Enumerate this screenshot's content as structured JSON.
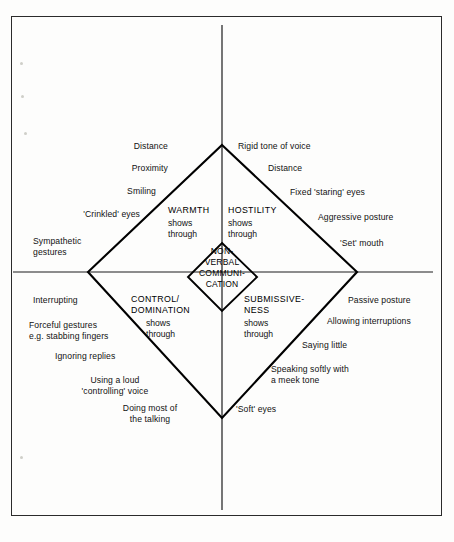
{
  "figure": {
    "type": "diagram",
    "subtype": "four-quadrant-diamond",
    "core_label": "NON-\nVERBAL\nCOMMUNI-\nCATION",
    "axes": {
      "vertical": "unlabelled vertical axis",
      "horizontal": "unlabelled horizontal axis"
    }
  },
  "quadrants": {
    "top_left": {
      "title": "WARMTH",
      "subtitle": "shows\nthrough",
      "cues": [
        "Distance",
        "Proximity",
        "Smiling",
        "'Crinkled' eyes",
        "Sympathetic\ngestures"
      ]
    },
    "top_right": {
      "title": "HOSTILITY",
      "subtitle": "shows\nthrough",
      "cues": [
        "Rigid tone of voice",
        "Distance",
        "Fixed 'staring' eyes",
        "Aggressive posture",
        "'Set' mouth"
      ]
    },
    "bottom_left": {
      "title": "CONTROL/\nDOMINATION",
      "subtitle": "shows\nthrough",
      "cues": [
        "Interrupting",
        "Forceful gestures\ne.g. stabbing fingers",
        "Ignoring replies",
        "Using a loud\n'controlling' voice",
        "Doing most of\nthe talking"
      ]
    },
    "bottom_right": {
      "title": "SUBMISSIVE-\nNESS",
      "subtitle": "shows\nthrough",
      "cues": [
        "Passive posture",
        "Allowing interruptions",
        "Saying little",
        "Speaking softly with\na meek tone",
        "'Soft' eyes"
      ]
    }
  },
  "colors": {
    "ink": "#000000",
    "frame": "#2b2b2b",
    "paper": "#fdfdfc"
  }
}
